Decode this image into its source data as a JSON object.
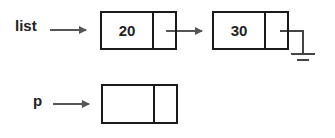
{
  "diagram": {
    "pointers": [
      {
        "label": "list",
        "points_to": "node-1"
      },
      {
        "label": "p",
        "points_to": "node-3"
      }
    ],
    "nodes": [
      {
        "id": "node-1",
        "data": "20",
        "next": "node-2"
      },
      {
        "id": "node-2",
        "data": "30",
        "next": "null"
      },
      {
        "id": "node-3",
        "data": "",
        "next": ""
      }
    ],
    "colors": {
      "line": "#1a1a1a",
      "arrow": "#555555",
      "text": "#222222"
    }
  }
}
